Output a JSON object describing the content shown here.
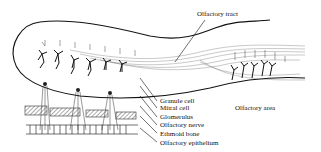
{
  "figure": {
    "labels": {
      "olfactory_tract": "Olfactory tract",
      "olfactory_area": "Olfactory area",
      "granule_cell": "Granule cell",
      "mitral_cell": "Mitral cell",
      "glomerulus": "Glomerulus",
      "olfactory_nerve": "Olfactory nerve",
      "ethmoid_bone": "Ethmoid bone",
      "olfactory_epithelium": "Olfactory epithelium"
    },
    "colors": {
      "ink": "#111111",
      "background": "#ffffff",
      "hatch": "#555555"
    }
  }
}
